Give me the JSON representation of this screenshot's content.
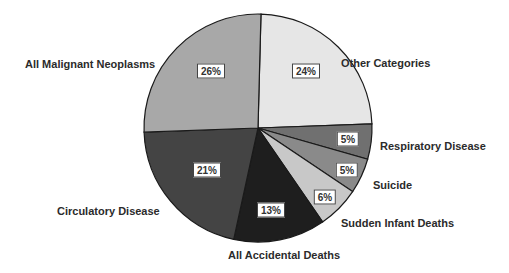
{
  "chart_data": {
    "type": "pie",
    "title": "",
    "start_angle_deg": 1.5,
    "direction": "clockwise",
    "center": [
      258,
      128
    ],
    "radius": 114,
    "slices": [
      {
        "label": "Other Categories",
        "value": 24,
        "pct_label": "24%",
        "color": "#e6e6e6"
      },
      {
        "label": "Respiratory Disease",
        "value": 5,
        "pct_label": "5%",
        "color": "#707070"
      },
      {
        "label": "Suicide",
        "value": 5,
        "pct_label": "5%",
        "color": "#8a8a8a"
      },
      {
        "label": "Sudden Infant Deaths",
        "value": 6,
        "pct_label": "6%",
        "color": "#c8c8c8"
      },
      {
        "label": "All Accidental Deaths",
        "value": 13,
        "pct_label": "13%",
        "color": "#1e1e1e"
      },
      {
        "label": "Circulatory Disease",
        "value": 21,
        "pct_label": "21%",
        "color": "#444444"
      },
      {
        "label": "All Malignant Neoplasms",
        "value": 26,
        "pct_label": "26%",
        "color": "#a8a8a8"
      }
    ],
    "category_label_positions": [
      {
        "x": 341,
        "y": 57
      },
      {
        "x": 380,
        "y": 140
      },
      {
        "x": 373,
        "y": 179
      },
      {
        "x": 341,
        "y": 217
      },
      {
        "x": 228,
        "y": 249
      },
      {
        "x": 57,
        "y": 205
      },
      {
        "x": 25,
        "y": 58
      }
    ],
    "pct_label_positions": [
      {
        "x": 306,
        "y": 71
      },
      {
        "x": 348,
        "y": 139
      },
      {
        "x": 347,
        "y": 170
      },
      {
        "x": 325,
        "y": 197
      },
      {
        "x": 271,
        "y": 210
      },
      {
        "x": 207,
        "y": 170
      },
      {
        "x": 211,
        "y": 71
      }
    ],
    "legend": "none",
    "grid": false
  }
}
